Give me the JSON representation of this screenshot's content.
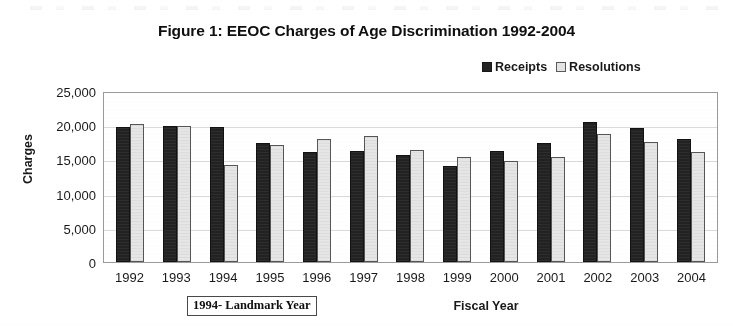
{
  "chart_data": {
    "type": "bar",
    "title": "Figure 1: EEOC Charges of Age Discrimination 1992-2004",
    "xlabel": "Fiscal Year",
    "ylabel": "Charges",
    "categories": [
      "1992",
      "1993",
      "1994",
      "1995",
      "1996",
      "1997",
      "1998",
      "1999",
      "2000",
      "2001",
      "2002",
      "2003",
      "2004"
    ],
    "series": [
      {
        "name": "Receipts",
        "color": "#242424",
        "values": [
          19800,
          19900,
          19800,
          17400,
          16100,
          16200,
          15600,
          14100,
          16300,
          17400,
          20500,
          19600,
          18000
        ]
      },
      {
        "name": "Resolutions",
        "color": "#e4e4e4",
        "values": [
          20200,
          19900,
          14200,
          17100,
          18000,
          18400,
          16400,
          15400,
          14800,
          15400,
          18700,
          17500,
          16100
        ]
      }
    ],
    "ylim": [
      0,
      25000
    ],
    "yticks": [
      25000,
      20000,
      15000,
      10000,
      5000,
      0
    ],
    "ytick_labels": [
      "25,000",
      "20,000",
      "15,000",
      "10,000",
      "5,000",
      "0"
    ],
    "grid": true,
    "legend_position": "top-right",
    "annotations": [
      {
        "text": "1994- Landmark Year",
        "boxed": true,
        "position": "below-axis-left"
      }
    ]
  },
  "legend": {
    "items": [
      {
        "label": "Receipts",
        "swatch": "filled-dark-square"
      },
      {
        "label": "Resolutions",
        "swatch": "outlined-light-square"
      }
    ]
  }
}
